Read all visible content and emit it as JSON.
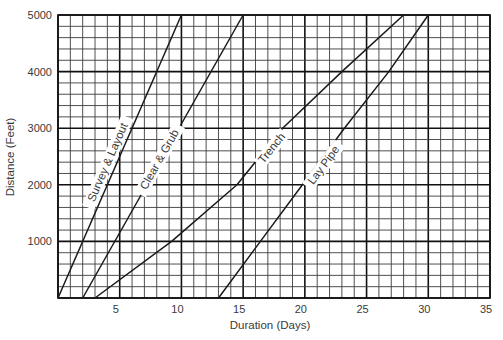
{
  "chart_data": {
    "type": "line",
    "title": "",
    "xlabel": "Duration (Days)",
    "ylabel": "Distance (Feet)",
    "xlim": [
      0,
      35
    ],
    "ylim": [
      0,
      5000
    ],
    "grid": true,
    "grid_minor_x": 1,
    "grid_minor_y": 200,
    "grid_major_x": 5,
    "grid_major_y": 1000,
    "legend": "none (labels placed along lines)",
    "x_ticks": [
      5,
      10,
      15,
      20,
      25,
      30,
      35
    ],
    "x_tick_labels": [
      "5",
      "10",
      "15",
      "20",
      "25",
      "30",
      "35"
    ],
    "y_ticks": [
      1000,
      2000,
      3000,
      4000,
      5000
    ],
    "y_tick_labels": [
      "1000",
      "2000",
      "3000",
      "4000",
      "5000"
    ],
    "series": [
      {
        "name": "Survey & Layout",
        "x": [
          0,
          10
        ],
        "y": [
          0,
          5000
        ],
        "label_at": {
          "x": 4.0,
          "y": 2400
        }
      },
      {
        "name": "Clear & Grub",
        "x": [
          2,
          15
        ],
        "y": [
          0,
          5000
        ],
        "label_at": {
          "x": 8.2,
          "y": 2450
        }
      },
      {
        "name": "Trench",
        "x": [
          3,
          9.2,
          14.5,
          18.2,
          23,
          28
        ],
        "y": [
          0,
          1000,
          2000,
          3000,
          4000,
          5000
        ],
        "label_at": {
          "x": 17.3,
          "y": 2650
        }
      },
      {
        "name": "Lay Pipe",
        "x": [
          13,
          16.4,
          19.8,
          23.2,
          26.8,
          30
        ],
        "y": [
          0,
          1000,
          2000,
          3000,
          4000,
          5000
        ],
        "label_at": {
          "x": 21.5,
          "y": 2350
        }
      }
    ]
  },
  "colors": {
    "line": "#1a1a1a",
    "grid_minor": "#3c3c3c",
    "grid_major": "#111111",
    "text": "#3a3a3a",
    "background": "#ffffff"
  }
}
